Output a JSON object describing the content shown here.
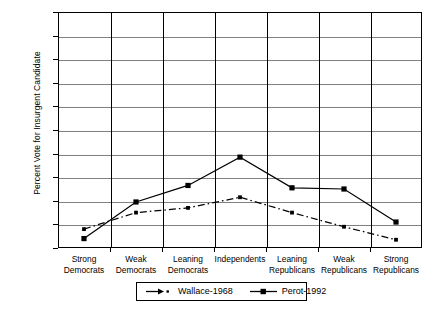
{
  "chart_data": {
    "type": "line",
    "title": "",
    "xlabel": "",
    "ylabel": "Percent Vote for Insurgent Candidate",
    "ylim": [
      0,
      100
    ],
    "yticks": [
      0,
      10,
      20,
      30,
      40,
      50,
      60,
      70,
      80,
      90,
      100
    ],
    "grid": true,
    "legend_position": "bottom",
    "categories": [
      "Strong\nDemocrats",
      "Weak\nDemocrats",
      "Leaning\nDemocrats",
      "Independents",
      "Leaning\nRepublicans",
      "Weak\nRepublicans",
      "Strong\nRepublicans"
    ],
    "category_lines": [
      [
        "Strong",
        "Democrats"
      ],
      [
        "Weak",
        "Democrats"
      ],
      [
        "Leaning",
        "Democrats"
      ],
      [
        "Independents",
        ""
      ],
      [
        "Leaning",
        "Republicans"
      ],
      [
        "Weak",
        "Republicans"
      ],
      [
        "Strong",
        "Republicans"
      ]
    ],
    "series": [
      {
        "name": "Wallace-1968",
        "style": "dash-dot",
        "marker": "small-square",
        "color": "#000000",
        "values": [
          8,
          15,
          17,
          21.5,
          15,
          9,
          3.5
        ]
      },
      {
        "name": "Perot-1992",
        "style": "solid",
        "marker": "square",
        "color": "#000000",
        "values": [
          4,
          19.5,
          26.5,
          38.5,
          25.5,
          25,
          11
        ]
      }
    ]
  },
  "legend": {
    "items": [
      {
        "label": "Wallace-1968",
        "sample": "dash-dot-line-marker-icon"
      },
      {
        "label": "Perot-1992",
        "sample": "solid-line-marker-icon"
      }
    ]
  },
  "colors": {
    "axis": "#000000",
    "gridline": "#808080",
    "background": "#ffffff",
    "series": "#000000"
  }
}
